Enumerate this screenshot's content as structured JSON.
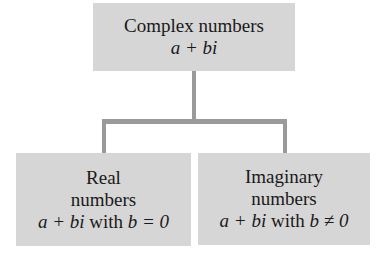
{
  "root": {
    "title": "Complex numbers",
    "formula": "a + bi"
  },
  "children": [
    {
      "title_line1": "Real",
      "title_line2": "numbers",
      "formula": "a + bi",
      "condition_text": " with ",
      "condition": "b = 0"
    },
    {
      "title_line1": "Imaginary",
      "title_line2": "numbers",
      "formula": "a + bi",
      "condition_text": " with ",
      "condition": "b ≠ 0"
    }
  ],
  "colors": {
    "box_fill": "#d6d6d6",
    "connector": "#9a9a9a",
    "text": "#1a1a1a"
  }
}
